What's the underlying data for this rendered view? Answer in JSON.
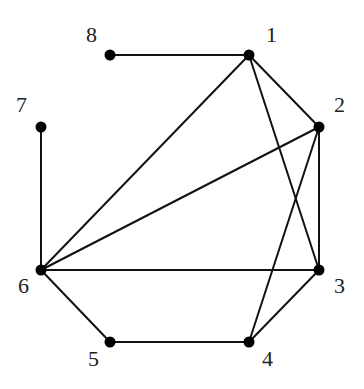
{
  "graph": {
    "nodes": [
      {
        "id": "1",
        "label": "1",
        "x": 249,
        "y": 55,
        "lx": 266,
        "ly": 42
      },
      {
        "id": "2",
        "label": "2",
        "x": 319,
        "y": 127,
        "lx": 334,
        "ly": 112
      },
      {
        "id": "3",
        "label": "3",
        "x": 319,
        "y": 270,
        "lx": 334,
        "ly": 293
      },
      {
        "id": "4",
        "label": "4",
        "x": 249,
        "y": 342,
        "lx": 262,
        "ly": 366
      },
      {
        "id": "5",
        "label": "5",
        "x": 110,
        "y": 342,
        "lx": 88,
        "ly": 366
      },
      {
        "id": "6",
        "label": "6",
        "x": 41,
        "y": 270,
        "lx": 18,
        "ly": 293
      },
      {
        "id": "7",
        "label": "7",
        "x": 41,
        "y": 127,
        "lx": 16,
        "ly": 112
      },
      {
        "id": "8",
        "label": "8",
        "x": 110,
        "y": 55,
        "lx": 86,
        "ly": 42
      }
    ],
    "edges": [
      [
        "8",
        "1"
      ],
      [
        "1",
        "2"
      ],
      [
        "1",
        "3"
      ],
      [
        "1",
        "6"
      ],
      [
        "2",
        "3"
      ],
      [
        "2",
        "4"
      ],
      [
        "2",
        "6"
      ],
      [
        "3",
        "4"
      ],
      [
        "3",
        "6"
      ],
      [
        "6",
        "5"
      ],
      [
        "5",
        "4"
      ],
      [
        "7",
        "6"
      ]
    ],
    "colors": {
      "edge": "#111111",
      "node": "#000000",
      "label": "#222222"
    }
  }
}
